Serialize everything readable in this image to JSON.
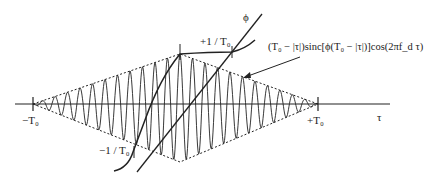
{
  "diagram": {
    "axis_label": "τ",
    "phi_label": "ϕ",
    "left_tick_label": "−T₀",
    "right_tick_label": "+T₀",
    "upper_slope_label": "+1 / T₀",
    "lower_slope_label": "−1 / T₀",
    "formula_label": "(T₀ − |τ|)sinc[ϕ(T₀ − |τ|)]cos(2πf_d τ)",
    "colors": {
      "line": "#222222",
      "background": "#ffffff"
    }
  }
}
